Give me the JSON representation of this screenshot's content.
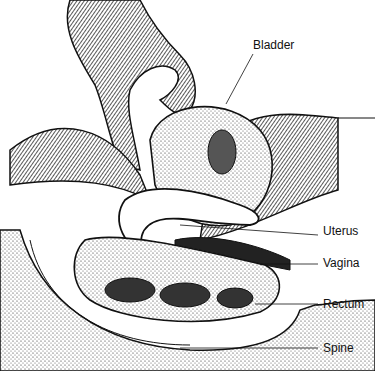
{
  "diagram": {
    "type": "anatomical-illustration",
    "labels": [
      {
        "id": "bladder",
        "text": "Bladder",
        "x": 253,
        "y": 46
      },
      {
        "id": "uterus",
        "text": "Uterus",
        "x": 323,
        "y": 231
      },
      {
        "id": "vagina",
        "text": "Vagina",
        "x": 323,
        "y": 259
      },
      {
        "id": "rectum",
        "text": "Rectum",
        "x": 323,
        "y": 300
      },
      {
        "id": "spine",
        "text": "Spine",
        "x": 323,
        "y": 344
      }
    ]
  }
}
